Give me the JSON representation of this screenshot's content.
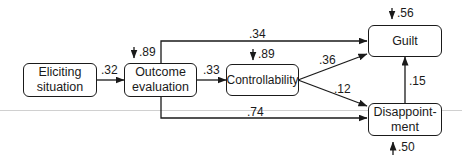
{
  "diagram": {
    "type": "path-model",
    "nodes": {
      "eliciting": {
        "line1": "Eliciting",
        "line2": "situation"
      },
      "outcome": {
        "line1": "Outcome",
        "line2": "evaluation"
      },
      "controllability": {
        "label": "Controllability"
      },
      "guilt": {
        "label": "Guilt"
      },
      "disappointment": {
        "line1": "Disappoint-",
        "line2": "ment"
      }
    },
    "paths": {
      "eliciting_outcome": ".32",
      "outcome_controllability": ".33",
      "outcome_guilt": ".34",
      "controllability_guilt": ".36",
      "controllability_disappointment": ".12",
      "outcome_disappointment": ".74",
      "disappointment_guilt": ".15"
    },
    "errors": {
      "outcome": ".89",
      "controllability": ".89",
      "guilt": ".56",
      "disappointment": ".50"
    }
  }
}
